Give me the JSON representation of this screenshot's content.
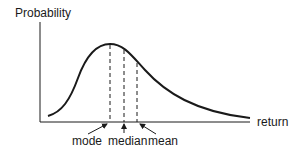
{
  "diagram": {
    "y_axis_label": "Probability",
    "x_axis_label": "return",
    "markers": [
      {
        "label": "mode",
        "order": 1
      },
      {
        "label": "median",
        "order": 2
      },
      {
        "label": "mean",
        "order": 3
      }
    ],
    "colors": {
      "ink": "#1a1a1a",
      "background": "#ffffff"
    }
  }
}
